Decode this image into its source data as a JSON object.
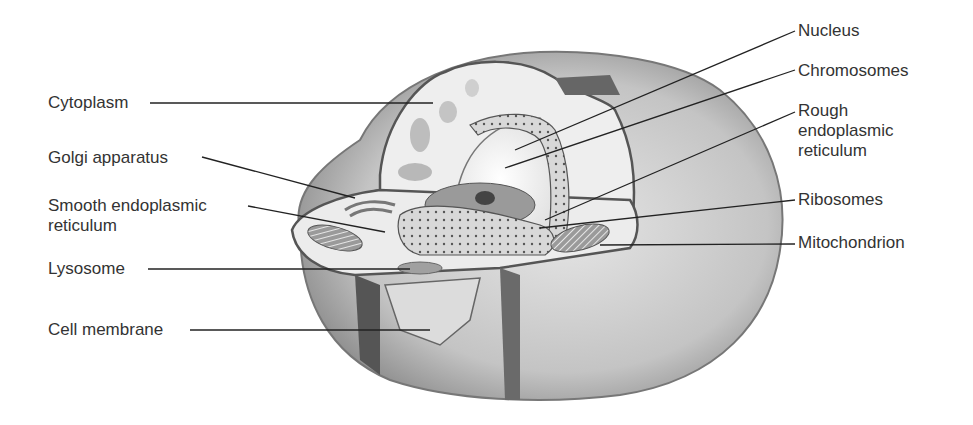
{
  "diagram": {
    "type": "labeled-illustration",
    "labels_left": [
      {
        "id": "cytoplasm",
        "text": "Cytoplasm",
        "x": 48,
        "y": 93
      },
      {
        "id": "golgi",
        "text": "Golgi apparatus",
        "x": 48,
        "y": 148
      },
      {
        "id": "ser",
        "text": "Smooth endoplasmic\nreticulum",
        "x": 48,
        "y": 196
      },
      {
        "id": "lysosome",
        "text": "Lysosome",
        "x": 48,
        "y": 259
      },
      {
        "id": "cell-membrane",
        "text": "Cell membrane",
        "x": 48,
        "y": 317
      }
    ],
    "labels_right": [
      {
        "id": "nucleus",
        "text": "Nucleus",
        "x": 798,
        "y": 21
      },
      {
        "id": "chromosomes",
        "text": "Chromosomes",
        "x": 798,
        "y": 61
      },
      {
        "id": "rer",
        "text": "Rough\nendoplasmic\nreticulum",
        "x": 798,
        "y": 101
      },
      {
        "id": "ribosomes",
        "text": "Ribosomes",
        "x": 798,
        "y": 190
      },
      {
        "id": "mitochondrion",
        "text": "Mitochondrion",
        "x": 798,
        "y": 233
      }
    ],
    "colors": {
      "text": "#333333",
      "line": "#222222",
      "cell_light": "#e8e8e8",
      "cell_mid": "#bdbdbd",
      "cell_dark": "#6e6e6e"
    }
  }
}
